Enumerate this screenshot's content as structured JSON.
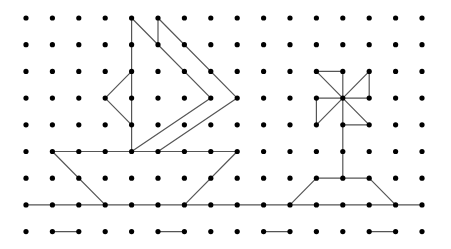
{
  "grid": {
    "columns": 16,
    "rows": 9,
    "origin_x": 26,
    "origin_y": 18,
    "spacing_x": 26.4,
    "spacing_y": 26.7,
    "dot_radius": 2.6,
    "dot_color": "#000000",
    "line_color": "#555555"
  },
  "figures": [
    {
      "name": "sailboat-sail",
      "segments": [
        [
          [
            4,
            0
          ],
          [
            4,
            5
          ]
        ],
        [
          [
            4,
            0
          ],
          [
            7,
            3
          ]
        ],
        [
          [
            7,
            3
          ],
          [
            4,
            5
          ]
        ],
        [
          [
            5,
            0
          ],
          [
            5,
            1
          ]
        ],
        [
          [
            5,
            0
          ],
          [
            8,
            3
          ]
        ],
        [
          [
            8,
            3
          ],
          [
            5,
            5
          ]
        ],
        [
          [
            4,
            2
          ],
          [
            3,
            3
          ]
        ],
        [
          [
            3,
            3
          ],
          [
            4,
            4
          ]
        ]
      ]
    },
    {
      "name": "sailboat-hull",
      "segments": [
        [
          [
            1,
            5
          ],
          [
            8,
            5
          ]
        ],
        [
          [
            1,
            5
          ],
          [
            3,
            7
          ]
        ],
        [
          [
            8,
            5
          ],
          [
            6,
            7
          ]
        ]
      ]
    },
    {
      "name": "palm-tree",
      "segments": [
        [
          [
            11,
            2
          ],
          [
            12,
            2
          ]
        ],
        [
          [
            11,
            2
          ],
          [
            13,
            4
          ]
        ],
        [
          [
            13,
            2
          ],
          [
            11,
            4
          ]
        ],
        [
          [
            13,
            2
          ],
          [
            13,
            3
          ]
        ],
        [
          [
            11,
            3
          ],
          [
            13,
            3
          ]
        ],
        [
          [
            11,
            3
          ],
          [
            11,
            4
          ]
        ],
        [
          [
            12,
            2
          ],
          [
            12,
            6
          ]
        ],
        [
          [
            12,
            4
          ],
          [
            13,
            4
          ]
        ]
      ]
    },
    {
      "name": "island",
      "segments": [
        [
          [
            10,
            7
          ],
          [
            11,
            6
          ]
        ],
        [
          [
            11,
            6
          ],
          [
            13,
            6
          ]
        ],
        [
          [
            13,
            6
          ],
          [
            14,
            7
          ]
        ]
      ]
    },
    {
      "name": "sea-line",
      "segments": [
        [
          [
            0,
            7
          ],
          [
            15,
            7
          ]
        ]
      ]
    },
    {
      "name": "waves",
      "segments": [
        [
          [
            1,
            8
          ],
          [
            2,
            8
          ]
        ],
        [
          [
            5,
            8
          ],
          [
            6,
            8
          ]
        ],
        [
          [
            9,
            8
          ],
          [
            10,
            8
          ]
        ],
        [
          [
            13,
            8
          ],
          [
            14,
            8
          ]
        ]
      ]
    }
  ]
}
